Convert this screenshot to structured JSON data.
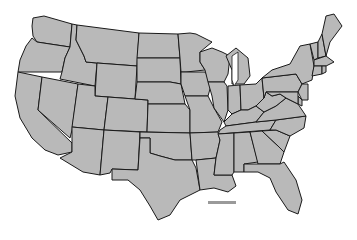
{
  "map": {
    "type": "us-states-outline",
    "fill_color": "#b9b9b9",
    "stroke_color": "#1a1a1a",
    "background": "#ffffff",
    "states": [
      "WA",
      "OR",
      "CA",
      "ID",
      "NV",
      "MT",
      "WY",
      "UT",
      "AZ",
      "CO",
      "NM",
      "ND",
      "SD",
      "NE",
      "KS",
      "OK",
      "TX",
      "MN",
      "IA",
      "MO",
      "AR",
      "LA",
      "WI",
      "IL",
      "MI",
      "IN",
      "OH",
      "KY",
      "TN",
      "MS",
      "AL",
      "GA",
      "FL",
      "SC",
      "NC",
      "VA",
      "WV",
      "PA",
      "NY",
      "VT",
      "NH",
      "ME",
      "MA",
      "CT",
      "RI",
      "NJ",
      "DE",
      "MD"
    ],
    "legend_bar_color": "#9a9a9a"
  }
}
